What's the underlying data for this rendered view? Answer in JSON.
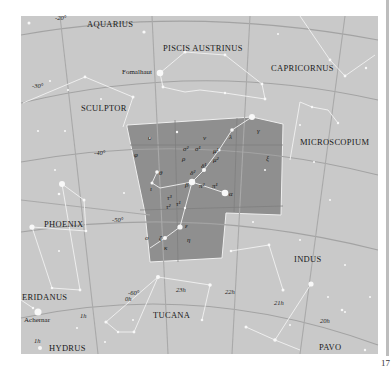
{
  "map": {
    "title_region": "Grus",
    "colors": {
      "background": "#c9c9c9",
      "highlight_region": "#8f8f8f",
      "grid_line": "#a8a8a8",
      "constellation_line": "#f2f2f2",
      "star": "#f8f8f8",
      "label": "#1a1a1a"
    },
    "constellations": [
      {
        "name": "AQUARIUS"
      },
      {
        "name": "PISCIS AUSTRINUS"
      },
      {
        "name": "CAPRICORNUS"
      },
      {
        "name": "SCULPTOR"
      },
      {
        "name": "MICROSCOPIUM"
      },
      {
        "name": "PHOENIX"
      },
      {
        "name": "INDUS"
      },
      {
        "name": "ERIDANUS"
      },
      {
        "name": "TUCANA"
      },
      {
        "name": "HYDRUS"
      },
      {
        "name": "PAVO"
      }
    ],
    "named_stars": [
      {
        "name": "Fomalhaut"
      },
      {
        "name": "Achernar"
      }
    ],
    "declination_labels": [
      "-20°",
      "-30°",
      "-40°",
      "-50°",
      "-60°"
    ],
    "ra_labels": [
      "23h",
      "22h",
      "21h",
      "20h",
      "1h",
      "0h",
      "1h"
    ],
    "greek_labels": [
      "υ",
      "ν",
      "φ",
      "σ²",
      "σ¹",
      "ρ",
      "μ¹",
      "μ²",
      "λ",
      "γ",
      "δ²",
      "δ¹",
      "θ",
      "ι",
      "β",
      "π²",
      "π¹",
      "α",
      "ξ",
      "τ³",
      "τ²",
      "τ¹",
      "κ",
      "ε",
      "ζ",
      "ο",
      "η"
    ]
  },
  "page": {
    "number": "17"
  }
}
